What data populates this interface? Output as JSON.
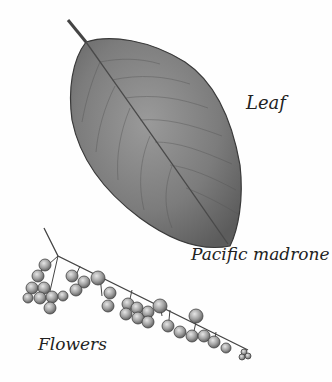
{
  "illustration": {
    "subject": "Pacific madrone",
    "labels": {
      "leaf": "Leaf",
      "species": "Pacific madrone",
      "flowers": "Flowers"
    },
    "colors": {
      "background": "#fefefe",
      "leaf_fill": "#7a7a7a",
      "leaf_outline": "#3a3a3a",
      "stem": "#444444",
      "flower_fill": "#9a9a9a",
      "text": "#222222"
    }
  }
}
